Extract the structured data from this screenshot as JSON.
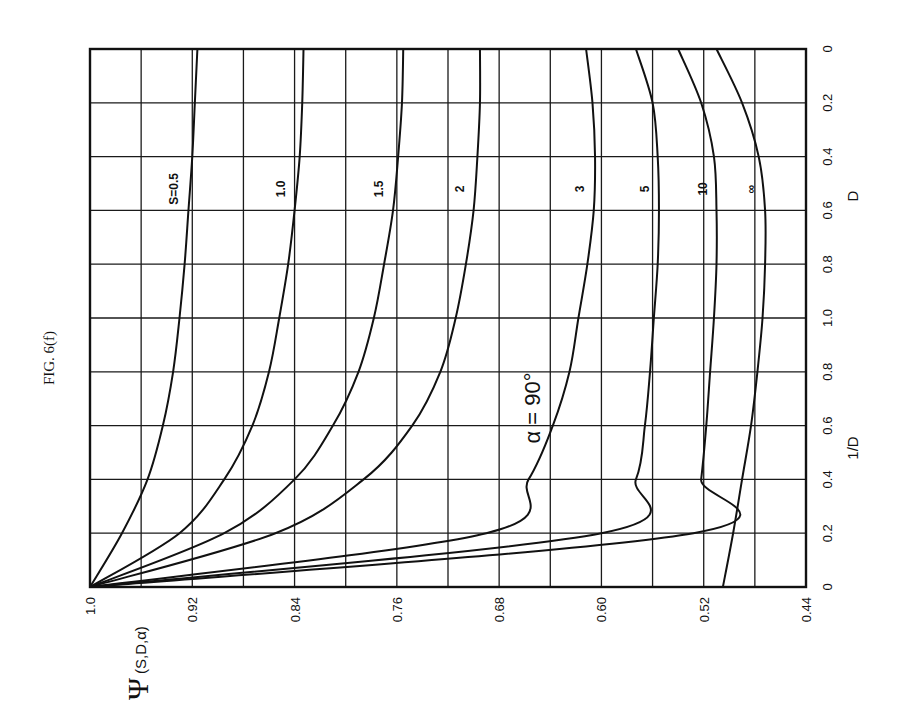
{
  "figure": {
    "title": "FIG. 6(f)",
    "annotation": "α = 90°",
    "y_axis_symbol": "Ψ",
    "y_axis_args": "(S,D,α)",
    "rotation_note": "Chart printed rotated 90° counter-clockwise"
  },
  "chart_data": {
    "type": "line",
    "title": "FIG. 6(f)",
    "annotation": "α = 90°",
    "ylabel": "Ψ(S,D,α)",
    "xlabel": "1/D (lower half) and D (upper half)",
    "ylim": [
      0.44,
      1.0
    ],
    "y_ticks": [
      "1.0",
      "0.92",
      "0.84",
      "0.76",
      "0.68",
      "0.60",
      "0.52",
      "0.44"
    ],
    "y_gridline_step": 0.04,
    "x_ticks_lower_1_over_D": [
      "0",
      "0.2",
      "0.4",
      "0.6",
      "0.8",
      "1.0"
    ],
    "x_ticks_upper_D": [
      "1.0",
      "0.8",
      "0.6",
      "0.4",
      "0.2",
      "0"
    ],
    "x_axis_label_lower": "1/D",
    "x_axis_label_upper": "D",
    "x_positions": [
      "1/D=0",
      "1/D=0.2",
      "1/D=0.4",
      "1/D=0.6",
      "1/D=0.8",
      "1/D=1.0 (D=1.0)",
      "D=0.8",
      "D=0.6",
      "D=0.4",
      "D=0.2",
      "D=0"
    ],
    "grid": true,
    "series": [
      {
        "name": "S = 0.5",
        "label": "S=0.5",
        "values": [
          1.0,
          0.975,
          0.955,
          0.943,
          0.935,
          0.93,
          0.926,
          0.923,
          0.92,
          0.918,
          0.916
        ]
      },
      {
        "name": "S = 1.0",
        "label": "1.0",
        "values": [
          1.0,
          0.93,
          0.895,
          0.873,
          0.86,
          0.852,
          0.845,
          0.84,
          0.836,
          0.834,
          0.833
        ]
      },
      {
        "name": "S = 1.5",
        "label": "1.5",
        "values": [
          1.0,
          0.895,
          0.84,
          0.81,
          0.79,
          0.778,
          0.77,
          0.763,
          0.759,
          0.756,
          0.755
        ]
      },
      {
        "name": "S = 2",
        "label": "2",
        "values": [
          1.0,
          0.855,
          0.786,
          0.748,
          0.726,
          0.714,
          0.706,
          0.7,
          0.697,
          0.695,
          0.695
        ]
      },
      {
        "name": "S = 3",
        "label": "3",
        "values": [
          1.0,
          0.69,
          0.657,
          0.638,
          0.625,
          0.618,
          0.611,
          0.606,
          0.605,
          0.607,
          0.612
        ]
      },
      {
        "name": "S = 5",
        "label": "5",
        "values": [
          1.0,
          0.6,
          0.573,
          0.566,
          0.562,
          0.559,
          0.556,
          0.555,
          0.556,
          0.56,
          0.573
        ]
      },
      {
        "name": "S = 10",
        "label": "10",
        "values": [
          1.0,
          0.528,
          0.522,
          0.518,
          0.515,
          0.512,
          0.51,
          0.51,
          0.512,
          0.522,
          0.54
        ]
      },
      {
        "name": "S = ∞",
        "label": "∞",
        "values": [
          0.505,
          0.497,
          0.49,
          0.483,
          0.478,
          0.474,
          0.472,
          0.472,
          0.477,
          0.49,
          0.51
        ]
      }
    ]
  }
}
